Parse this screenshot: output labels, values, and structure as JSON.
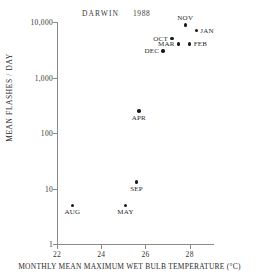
{
  "chart_data": {
    "type": "scatter",
    "title": "DARWIN",
    "annotation": "DARWIN",
    "annotation_year": "1988",
    "xlabel": "MONTHLY MEAN MAXIMUM WET BULB TEMPERATURE (°C)",
    "ylabel": "MEAN FLASHES / DAY",
    "xlim": [
      22,
      29.1
    ],
    "ylim": [
      1,
      10000
    ],
    "yscale": "log",
    "xscale": "linear",
    "grid": false,
    "legend": "none",
    "xticks": [
      22,
      24,
      26,
      28
    ],
    "xticklabels": [
      "22",
      "24",
      "26",
      "28"
    ],
    "yticks": [
      1,
      10,
      100,
      1000,
      10000
    ],
    "yticklabels": [
      "1",
      "10",
      "100",
      "1,000",
      "10,000"
    ],
    "marker_color": "#1a1a1a",
    "axis_color": "#8a8a8a",
    "points": [
      {
        "label": "NOV",
        "x": 27.8,
        "y": 8800,
        "label_pos": "above"
      },
      {
        "label": "JAN",
        "x": 28.3,
        "y": 7000,
        "label_pos": "right"
      },
      {
        "label": "OCT",
        "x": 27.2,
        "y": 5000,
        "label_pos": "left"
      },
      {
        "label": "MAR",
        "x": 27.5,
        "y": 4000,
        "label_pos": "left"
      },
      {
        "label": "FEB",
        "x": 28.0,
        "y": 4000,
        "label_pos": "right"
      },
      {
        "label": "DEC",
        "x": 26.8,
        "y": 3000,
        "label_pos": "left"
      },
      {
        "label": "APR",
        "x": 25.7,
        "y": 250,
        "label_pos": "below"
      },
      {
        "label": "SEP",
        "x": 25.6,
        "y": 13,
        "label_pos": "below"
      },
      {
        "label": "MAY",
        "x": 25.1,
        "y": 5,
        "label_pos": "below"
      },
      {
        "label": "AUG",
        "x": 22.7,
        "y": 5,
        "label_pos": "below"
      }
    ]
  }
}
